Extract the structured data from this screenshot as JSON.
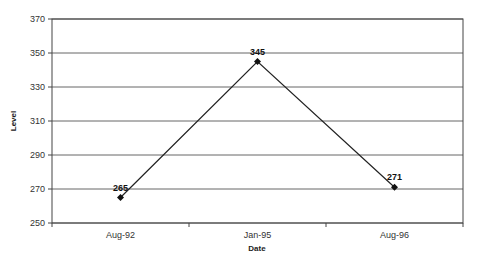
{
  "chart_data": {
    "type": "line",
    "title": "",
    "xlabel": "Date",
    "ylabel": "Level",
    "categories": [
      "Aug-92",
      "Jan-95",
      "Aug-96"
    ],
    "series": [
      {
        "name": "Level",
        "values": [
          265,
          345,
          271
        ],
        "color": "#222222",
        "marker": "diamond"
      }
    ],
    "data_labels": [
      "265",
      "345",
      "271"
    ],
    "yticks": [
      "250",
      "270",
      "290",
      "310",
      "330",
      "350",
      "370"
    ],
    "ylim": [
      250,
      370
    ],
    "grid": true,
    "legend": "none"
  }
}
